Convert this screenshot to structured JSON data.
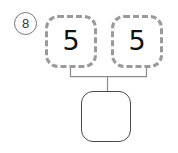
{
  "worksheet": {
    "problem_number": "8",
    "problem_number_style": "circled",
    "type": "number-bond",
    "parts": [
      {
        "label": "5",
        "border": "dashed",
        "border_color": "#9a9a9a"
      },
      {
        "label": "5",
        "border": "dashed",
        "border_color": "#9a9a9a"
      }
    ],
    "whole": {
      "label": "",
      "border": "solid",
      "border_color": "#4a4a4a",
      "is_answer_blank": true
    },
    "connector": {
      "style": "bracket",
      "color": "#8c8c8c"
    },
    "background_color": "#ffffff"
  }
}
